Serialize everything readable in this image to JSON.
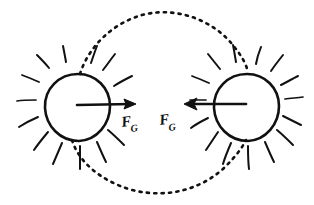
{
  "diagram": {
    "background_color": "#ffffff",
    "ink_color": "#111111",
    "width": 314,
    "height": 205,
    "style": "hand-drawn sketch"
  },
  "bodies": [
    {
      "id": "left-body",
      "name": "left-celestial-body",
      "label": "",
      "center_x": 77,
      "center_y": 107,
      "radius": 33,
      "ray_count": 12,
      "icon": "sun-icon"
    },
    {
      "id": "right-body",
      "name": "right-celestial-body",
      "label": "",
      "center_x": 246,
      "center_y": 107,
      "radius": 33,
      "ray_count": 12,
      "icon": "sun-icon"
    }
  ],
  "orbit": {
    "name": "orbital-path",
    "style": "dotted",
    "center_x": 161,
    "center_y": 104,
    "radius_x": 82,
    "radius_y": 92,
    "description": "dotted ellipse passing through both bodies"
  },
  "forces": [
    {
      "id": "left-force",
      "symbol": "F",
      "subscript": "G",
      "direction": "right",
      "origin_x": 77,
      "origin_y": 105,
      "tip_x": 134,
      "tip_y": 104,
      "label_x": 124,
      "label_y": 125
    },
    {
      "id": "right-force",
      "symbol": "F",
      "subscript": "G",
      "direction": "left",
      "origin_x": 246,
      "origin_y": 104,
      "tip_x": 185,
      "tip_y": 104,
      "label_x": 163,
      "label_y": 124
    }
  ]
}
